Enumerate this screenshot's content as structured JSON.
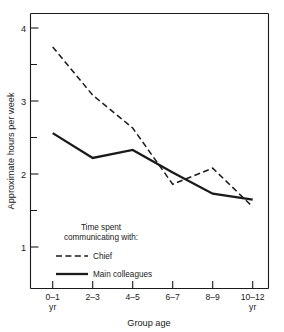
{
  "chart_data": {
    "type": "line",
    "title": "",
    "xlabel": "Group age",
    "ylabel": "Approximate hours per week",
    "categories": [
      "0–1\nyr",
      "2–3",
      "4–5",
      "6–7",
      "8–9",
      "10–12\nyr"
    ],
    "category_labels": [
      {
        "line1": "0–1",
        "line2": "yr"
      },
      {
        "line1": "2–3",
        "line2": ""
      },
      {
        "line1": "4–5",
        "line2": ""
      },
      {
        "line1": "6–7",
        "line2": ""
      },
      {
        "line1": "8–9",
        "line2": ""
      },
      {
        "line1": "10–12",
        "line2": "yr"
      }
    ],
    "ylim": [
      0.44,
      4.28
    ],
    "yticks": [
      1,
      2,
      3,
      4
    ],
    "ytick_labels": [
      "1",
      "2",
      "3",
      "4"
    ],
    "yminor_ticks": [
      1.5,
      2.5,
      3.5
    ],
    "grid": false,
    "legend_position": "inside-lower-left",
    "legend_title_line1": "Time spent",
    "legend_title_line2": "communicating with:",
    "series": [
      {
        "name": "Chief",
        "style": "dashed",
        "color": "#1a1a1a",
        "values": [
          3.74,
          3.08,
          2.63,
          1.86,
          2.08,
          1.55
        ]
      },
      {
        "name": "Main colleagues",
        "style": "solid",
        "color": "#1a1a1a",
        "values": [
          2.56,
          2.22,
          2.33,
          2.02,
          1.73,
          1.65
        ]
      }
    ]
  }
}
